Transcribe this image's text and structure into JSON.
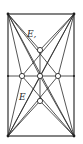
{
  "diagram": {
    "type": "geometric-construction",
    "labels": {
      "upper": "E,",
      "lower": "E"
    },
    "colors": {
      "ink": "#2a2a2a",
      "background": "#ffffff"
    },
    "frame": {
      "x": 8,
      "y": 14,
      "width": 66,
      "height": 122
    },
    "nodes": [
      {
        "id": "top",
        "x": 40,
        "y": 50
      },
      {
        "id": "left",
        "x": 22,
        "y": 76
      },
      {
        "id": "center",
        "x": 40,
        "y": 76
      },
      {
        "id": "right",
        "x": 58,
        "y": 76
      },
      {
        "id": "bottom",
        "x": 40,
        "y": 101
      }
    ]
  }
}
